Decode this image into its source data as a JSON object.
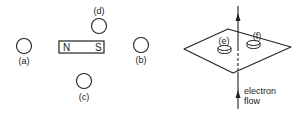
{
  "left_diagram": {
    "magnet": {
      "north_label": "N",
      "south_label": "S"
    },
    "compasses": [
      {
        "id": "a",
        "label": "(a)"
      },
      {
        "id": "b",
        "label": "(b)"
      },
      {
        "id": "c",
        "label": "(c)"
      },
      {
        "id": "d",
        "label": "(d)"
      }
    ]
  },
  "right_diagram": {
    "compasses": [
      {
        "id": "e",
        "label": "(e)"
      },
      {
        "id": "f",
        "label": "(f)"
      }
    ],
    "current_label_line1": "electron",
    "current_label_line2": "flow"
  },
  "colors": {
    "stroke": "#222222",
    "background": "#ffffff"
  }
}
